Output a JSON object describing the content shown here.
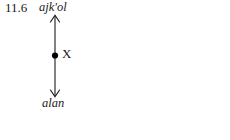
{
  "figure": {
    "example_number": "11.6",
    "axis": {
      "orientation": "vertical",
      "arrow_style": "double-headed",
      "stroke_color": "#1a1a1a",
      "up_label": "ajk'ol",
      "down_label": "alan"
    },
    "reference_point": {
      "marker": "filled-dot",
      "marker_color": "#000000",
      "label": "X"
    }
  }
}
